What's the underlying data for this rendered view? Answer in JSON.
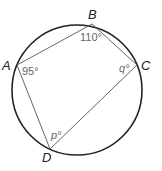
{
  "diagram": {
    "type": "cyclic-quadrilateral",
    "circle": {
      "cx": 77,
      "cy": 90,
      "r": 65
    },
    "points": {
      "A": {
        "label": "A",
        "x": 17,
        "y": 65
      },
      "B": {
        "label": "B",
        "x": 92,
        "y": 24
      },
      "C": {
        "label": "C",
        "x": 137,
        "y": 65
      },
      "D": {
        "label": "D",
        "x": 50,
        "y": 149
      }
    },
    "angles": {
      "A": "95°",
      "B": "110°",
      "C": "q°",
      "D": "p°"
    },
    "colors": {
      "circle": "#222222",
      "chord": "#555555",
      "label": "#222222",
      "angle_text": "#666666"
    }
  }
}
